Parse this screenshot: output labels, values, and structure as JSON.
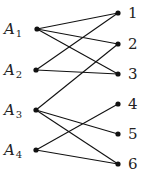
{
  "diagram": {
    "type": "bipartite-graph",
    "left_nodes": [
      {
        "id": "A1",
        "base": "A",
        "sub": "1",
        "x": 37,
        "y": 29
      },
      {
        "id": "A2",
        "base": "A",
        "sub": "2",
        "x": 36,
        "y": 70
      },
      {
        "id": "A3",
        "base": "A",
        "sub": "3",
        "x": 36,
        "y": 110
      },
      {
        "id": "A4",
        "base": "A",
        "sub": "4",
        "x": 36,
        "y": 150
      }
    ],
    "right_nodes": [
      {
        "id": "1",
        "label": "1",
        "x": 118,
        "y": 13
      },
      {
        "id": "2",
        "label": "2",
        "x": 118,
        "y": 44
      },
      {
        "id": "3",
        "label": "3",
        "x": 118,
        "y": 74
      },
      {
        "id": "4",
        "label": "4",
        "x": 118,
        "y": 104
      },
      {
        "id": "5",
        "label": "5",
        "x": 118,
        "y": 134
      },
      {
        "id": "6",
        "label": "6",
        "x": 118,
        "y": 164
      }
    ],
    "edges": [
      [
        "A1",
        "1"
      ],
      [
        "A1",
        "2"
      ],
      [
        "A1",
        "3"
      ],
      [
        "A2",
        "1"
      ],
      [
        "A2",
        "3"
      ],
      [
        "A3",
        "2"
      ],
      [
        "A3",
        "5"
      ],
      [
        "A3",
        "6"
      ],
      [
        "A4",
        "4"
      ],
      [
        "A4",
        "6"
      ]
    ],
    "colors": {
      "line": "#111111",
      "node": "#111111",
      "text": "#222222"
    }
  }
}
